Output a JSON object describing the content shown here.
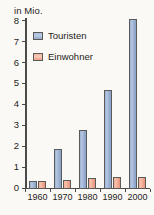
{
  "chart_data": {
    "type": "bar",
    "title": "",
    "subtitle": "",
    "xlabel": "",
    "ylabel": "in Mio.",
    "categories": [
      "1960",
      "1970",
      "1980",
      "1990",
      "2000"
    ],
    "series": [
      {
        "name": "Touristen",
        "color": "#9db3d4",
        "values": [
          0.35,
          1.9,
          2.8,
          4.7,
          8.1
        ]
      },
      {
        "name": "Einwohner",
        "color": "#f2ad96",
        "values": [
          0.35,
          0.4,
          0.52,
          0.55,
          0.55
        ]
      }
    ],
    "ylim": [
      0,
      8
    ],
    "yticks": [
      "0",
      "1",
      "2",
      "3",
      "4",
      "5",
      "6",
      "7",
      "8"
    ],
    "grid": false,
    "legend_position": "top-left"
  },
  "axis": {
    "unit_caption": "in Mio."
  },
  "legend": {
    "items": [
      {
        "label": "Touristen"
      },
      {
        "label": "Einwohner"
      }
    ]
  }
}
